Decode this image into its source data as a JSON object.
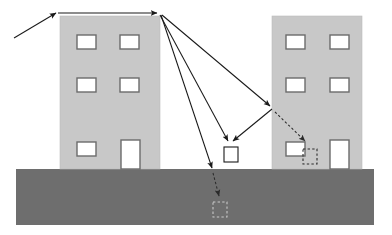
{
  "diagram": {
    "canvas": {
      "width": 392,
      "height": 235,
      "background": "#ffffff"
    },
    "colors": {
      "building_fill": "#c8c8c8",
      "building_edge": "#b4b4b4",
      "window_fill": "#ffffff",
      "window_edge": "#6b6b6b",
      "ground_fill": "#6e6e6e",
      "ray_solid": "#1a1a1a",
      "ray_dashed": "#4a4a4a",
      "receiver_fill": "#ffffff",
      "receiver_edge": "#1a1a1a"
    },
    "ground": {
      "label": "ground-surface",
      "x": 16,
      "y": 169,
      "width": 358,
      "height": 56,
      "fill": "#6e6e6e"
    },
    "buildings": [
      {
        "label": "left-building",
        "x": 60,
        "y": 16,
        "width": 100,
        "height": 153,
        "fill": "#c8c8c8",
        "windows": [
          {
            "label": "window-r1c1",
            "x": 77,
            "y": 35,
            "width": 19,
            "height": 14
          },
          {
            "label": "window-r1c2",
            "x": 120,
            "y": 35,
            "width": 19,
            "height": 14
          },
          {
            "label": "window-r2c1",
            "x": 77,
            "y": 78,
            "width": 19,
            "height": 14
          },
          {
            "label": "window-r2c2",
            "x": 120,
            "y": 78,
            "width": 19,
            "height": 14
          },
          {
            "label": "window-r3c1",
            "x": 77,
            "y": 142,
            "width": 19,
            "height": 14
          },
          {
            "label": "door-r3c2",
            "x": 121,
            "y": 140,
            "width": 19,
            "height": 29
          }
        ]
      },
      {
        "label": "right-building",
        "x": 272,
        "y": 16,
        "width": 90,
        "height": 153,
        "fill": "#c8c8c8",
        "windows": [
          {
            "label": "window-r1c1",
            "x": 286,
            "y": 35,
            "width": 19,
            "height": 14
          },
          {
            "label": "window-r1c2",
            "x": 330,
            "y": 35,
            "width": 19,
            "height": 14
          },
          {
            "label": "window-r2c1",
            "x": 286,
            "y": 78,
            "width": 19,
            "height": 14
          },
          {
            "label": "window-r2c2",
            "x": 330,
            "y": 78,
            "width": 19,
            "height": 14
          },
          {
            "label": "window-r3c1",
            "x": 286,
            "y": 142,
            "width": 19,
            "height": 14
          },
          {
            "label": "door-r3c2",
            "x": 330,
            "y": 140,
            "width": 19,
            "height": 29
          }
        ]
      }
    ],
    "rays": {
      "incident": {
        "label": "incident-ray",
        "x1": 14,
        "y1": 38,
        "x2": 56,
        "y2": 13,
        "style": "solid",
        "arrow": "end"
      },
      "rooftop": {
        "label": "rooftop-grazing-ray",
        "x1": 58,
        "y1": 13,
        "x2": 159,
        "y2": 13,
        "style": "solid",
        "arrow": "end"
      },
      "diffracted": [
        {
          "label": "diffracted-ray-direct",
          "x1": 160,
          "y1": 15,
          "x2": 228,
          "y2": 144,
          "style": "solid",
          "arrow": "end"
        },
        {
          "label": "diffracted-ray-ground-bounce",
          "x1": 161,
          "y1": 15,
          "x2": 212,
          "y2": 171,
          "style": "solid",
          "arrow": "end"
        },
        {
          "label": "diffracted-ray-to-right-wall",
          "x1": 162,
          "y1": 15,
          "x2": 272,
          "y2": 108,
          "style": "solid",
          "arrow": "end"
        }
      ],
      "reflected": {
        "label": "wall-reflected-ray",
        "x1": 272,
        "y1": 109,
        "x2": 231,
        "y2": 144,
        "style": "solid",
        "arrow": "end"
      },
      "transmitted": [
        {
          "label": "penetration-ray-into-right-building",
          "x1": 274,
          "y1": 111,
          "x2": 306,
          "y2": 144,
          "style": "dashed",
          "arrow": "end"
        },
        {
          "label": "penetration-ray-into-ground",
          "x1": 213,
          "y1": 173,
          "x2": 220,
          "y2": 199,
          "style": "dashed",
          "arrow": "end"
        }
      ]
    },
    "receivers": [
      {
        "label": "receiver-outdoor",
        "x": 224,
        "y": 147,
        "width": 14,
        "height": 15,
        "style": "solid",
        "fill": "#ffffff"
      },
      {
        "label": "receiver-indoor-shadow",
        "x": 303,
        "y": 149,
        "width": 14,
        "height": 15,
        "style": "dashed",
        "fill": "none"
      },
      {
        "label": "receiver-underground-shadow",
        "x": 213,
        "y": 202,
        "width": 14,
        "height": 15,
        "style": "dashed",
        "fill": "none"
      }
    ]
  }
}
